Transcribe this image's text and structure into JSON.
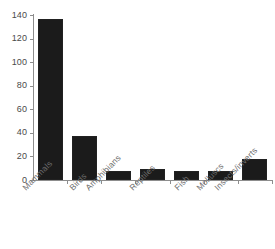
{
  "chart_data": {
    "type": "bar",
    "title": "",
    "subtitle": "",
    "xlabel": "",
    "ylabel": "",
    "categories": [
      "Mammals",
      "Birds",
      "Amphibians",
      "Reptiles",
      "Fish",
      "Molluscs",
      "Insects/inverts"
    ],
    "values": [
      137,
      37,
      8,
      9,
      8,
      8,
      18
    ],
    "ylim": [
      0,
      140
    ],
    "yticks": [
      0,
      20,
      40,
      60,
      80,
      100,
      120,
      140
    ],
    "ytick_labels": [
      "0",
      "20",
      "40",
      "60",
      "80",
      "100",
      "120",
      "140"
    ],
    "grid": false,
    "legend": false,
    "legend_position": "none",
    "bar_color": "#1b1b1b",
    "axis_color": "#8d8d8d",
    "tick_label_color": "#4a4a4a",
    "category_label_color": "#6d6d6d",
    "category_label_rotation": -45,
    "background_color": "#ffffff",
    "series": [
      {
        "name": "count",
        "values": [
          137,
          37,
          8,
          9,
          8,
          8,
          18
        ]
      }
    ],
    "points": [
      {
        "category": "Mammals",
        "value": 137
      },
      {
        "category": "Birds",
        "value": 37
      },
      {
        "category": "Amphibians",
        "value": 8
      },
      {
        "category": "Reptiles",
        "value": 9
      },
      {
        "category": "Fish",
        "value": 8
      },
      {
        "category": "Molluscs",
        "value": 8
      },
      {
        "category": "Insects/inverts",
        "value": 18
      }
    ]
  }
}
